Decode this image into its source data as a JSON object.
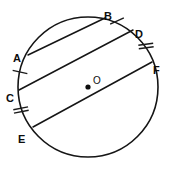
{
  "figure": {
    "kind": "geometry-diagram",
    "background_color": "#ffffff",
    "stroke_color": "#151515",
    "label_color": "#0d0d0d"
  },
  "circle": {
    "name": "circle-O",
    "center_label": "O",
    "center": {
      "x": 88,
      "y": 87
    },
    "radius": 70,
    "center_dot_radius": 2.6
  },
  "points": [
    {
      "id": "A",
      "label": "A",
      "x": 28,
      "y": 55,
      "label_x": 13,
      "label_y": 54,
      "on": "circle"
    },
    {
      "id": "B",
      "label": "B",
      "x": 105,
      "y": 18,
      "label_x": 104,
      "label_y": 12,
      "on": "circle"
    },
    {
      "id": "C",
      "label": "C",
      "x": 19,
      "y": 90,
      "label_x": 6,
      "label_y": 94,
      "on": "circle"
    },
    {
      "id": "D",
      "label": "D",
      "x": 133,
      "y": 30,
      "label_x": 135,
      "label_y": 30,
      "on": "circle"
    },
    {
      "id": "E",
      "label": "E",
      "x": 33,
      "y": 127,
      "label_x": 18,
      "label_y": 135,
      "on": "circle"
    },
    {
      "id": "F",
      "label": "F",
      "x": 152,
      "y": 62,
      "label_x": 153,
      "label_y": 66,
      "on": "circle"
    }
  ],
  "chords": [
    {
      "name": "chord-AB",
      "from": "A",
      "to": "B",
      "x1": 28,
      "y1": 55,
      "x2": 105,
      "y2": 18
    },
    {
      "name": "chord-CD",
      "from": "C",
      "to": "D",
      "x1": 19,
      "y1": 90,
      "x2": 133,
      "y2": 30
    },
    {
      "name": "chord-EF",
      "from": "E",
      "to": "F",
      "x1": 33,
      "y1": 127,
      "x2": 152,
      "y2": 62
    }
  ],
  "arc_ticks": [
    {
      "name": "arc-tick-AC",
      "arc": "AC",
      "count": 1,
      "center_x": 20,
      "center_y": 72,
      "angle_deg": 12,
      "length": 15,
      "spacing": 3.5
    },
    {
      "name": "arc-tick-BD",
      "arc": "BD",
      "count": 1,
      "center_x": 117,
      "center_y": 21,
      "angle_deg": -24,
      "length": 15,
      "spacing": 3.5
    },
    {
      "name": "arc-tick-CE",
      "arc": "CE",
      "count": 2,
      "center_x": 21,
      "center_y": 110,
      "angle_deg": -11,
      "length": 15,
      "spacing": 3.5
    },
    {
      "name": "arc-tick-DF",
      "arc": "DF",
      "count": 2,
      "center_x": 146,
      "center_y": 46,
      "angle_deg": -8,
      "length": 15,
      "spacing": 3.5
    }
  ]
}
